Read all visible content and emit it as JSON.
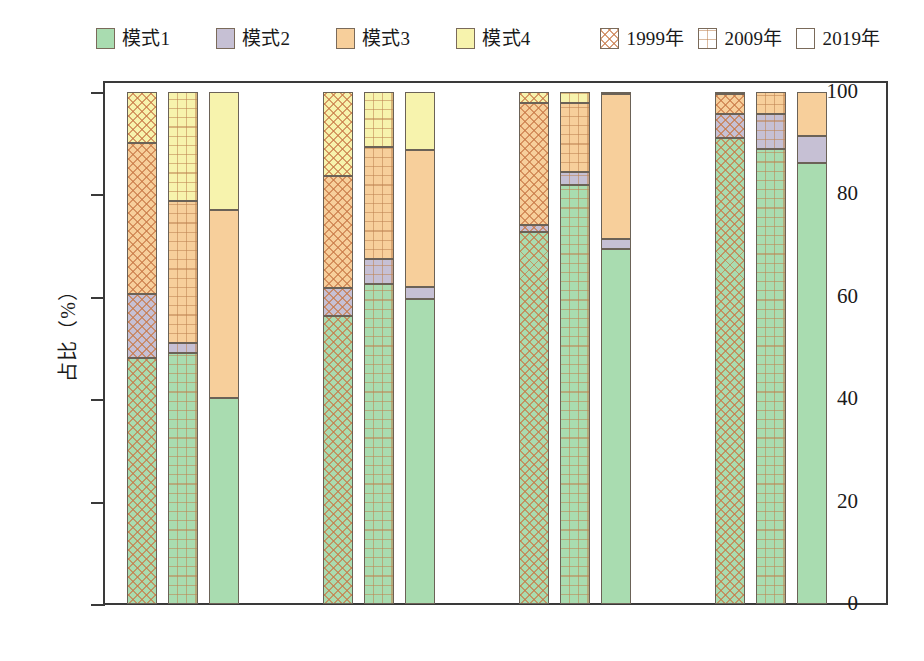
{
  "legend": {
    "mode_items": [
      {
        "label": "模式1",
        "color": "#a9dcb0",
        "swatch": "mode1-swatch"
      },
      {
        "label": "模式2",
        "color": "#c6c0d4",
        "swatch": "mode2-swatch"
      },
      {
        "label": "模式3",
        "color": "#f7cf9b",
        "swatch": "mode3-swatch"
      },
      {
        "label": "模式4",
        "color": "#f7f3ad",
        "swatch": "mode4-swatch"
      }
    ],
    "year_items": [
      {
        "label": "1999年",
        "pattern": "crosshatch-diagonal"
      },
      {
        "label": "2009年",
        "pattern": "grid-dotted"
      },
      {
        "label": "2019年",
        "pattern": "solid-plain"
      }
    ]
  },
  "axes": {
    "ylabel": "占比（%）",
    "yticks": [
      "100",
      "80",
      "60",
      "40",
      "20",
      "0"
    ],
    "ytick_values": [
      100,
      80,
      60,
      40,
      20,
      0
    ],
    "ylim": [
      0,
      100
    ],
    "xticks": [
      "全球级",
      "国际级",
      "国家级",
      "非枢纽"
    ]
  },
  "chart_data": {
    "type": "bar",
    "subtype": "stacked-grouped-100percent",
    "title": "",
    "xlabel": "",
    "ylabel": "占比（%）",
    "ylim": [
      0,
      100
    ],
    "grid": false,
    "legend_position": "top",
    "categories": [
      "全球级",
      "国际级",
      "国家级",
      "非枢纽"
    ],
    "subgroups": [
      "1999年",
      "2009年",
      "2019年"
    ],
    "stack_order": [
      "模式1",
      "模式2",
      "模式3",
      "模式4"
    ],
    "colors": {
      "模式1": "#a9dcb0",
      "模式2": "#c6c0d4",
      "模式3": "#f7cf9b",
      "模式4": "#f7f3ad"
    },
    "series": [
      {
        "name": "模式1",
        "values": {
          "全球级": [
            48.0,
            49.0,
            40.3
          ],
          "国际级": [
            56.2,
            62.5,
            59.5
          ],
          "国家级": [
            72.6,
            81.8,
            69.4
          ],
          "非枢纽": [
            91.0,
            88.9,
            86.2
          ]
        }
      },
      {
        "name": "模式2",
        "values": {
          "全球级": [
            12.5,
            1.9,
            0.0
          ],
          "国际级": [
            5.5,
            4.8,
            2.5
          ],
          "国家级": [
            1.4,
            2.5,
            1.8
          ],
          "非枢纽": [
            4.8,
            6.8,
            5.2
          ]
        }
      },
      {
        "name": "模式3",
        "values": {
          "全球级": [
            29.5,
            27.8,
            36.7
          ],
          "国际级": [
            21.9,
            21.9,
            26.7
          ],
          "国家级": [
            23.8,
            13.5,
            28.5
          ],
          "非枢纽": [
            3.8,
            4.3,
            8.6
          ]
        }
      },
      {
        "name": "模式4",
        "values": {
          "全球级": [
            10.0,
            21.3,
            23.0
          ],
          "国际级": [
            16.4,
            10.8,
            11.3
          ],
          "国家级": [
            2.2,
            2.2,
            0.3
          ],
          "非枢纽": [
            0.4,
            0.0,
            0.0
          ]
        }
      }
    ]
  }
}
